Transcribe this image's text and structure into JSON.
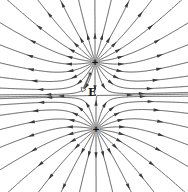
{
  "diagram": {
    "charges": [
      {
        "name": "upper-charge",
        "sign": "+",
        "x": 95,
        "y": 62,
        "q": 1
      },
      {
        "name": "lower-charge",
        "sign": "+",
        "x": 96,
        "y": 129,
        "q": 1
      }
    ],
    "lines_per_charge": 22,
    "field_label": "E",
    "test_point": {
      "x": 90,
      "y": 74
    },
    "field_vector_tip": {
      "x": 82,
      "y": 92
    },
    "label_pos": {
      "x": 88,
      "y": 86
    },
    "colors": {
      "line": "#4a4a4a",
      "arrow": "#3a3a3a",
      "charge_glow": "#9a9a9a",
      "vector": "#666666"
    }
  }
}
